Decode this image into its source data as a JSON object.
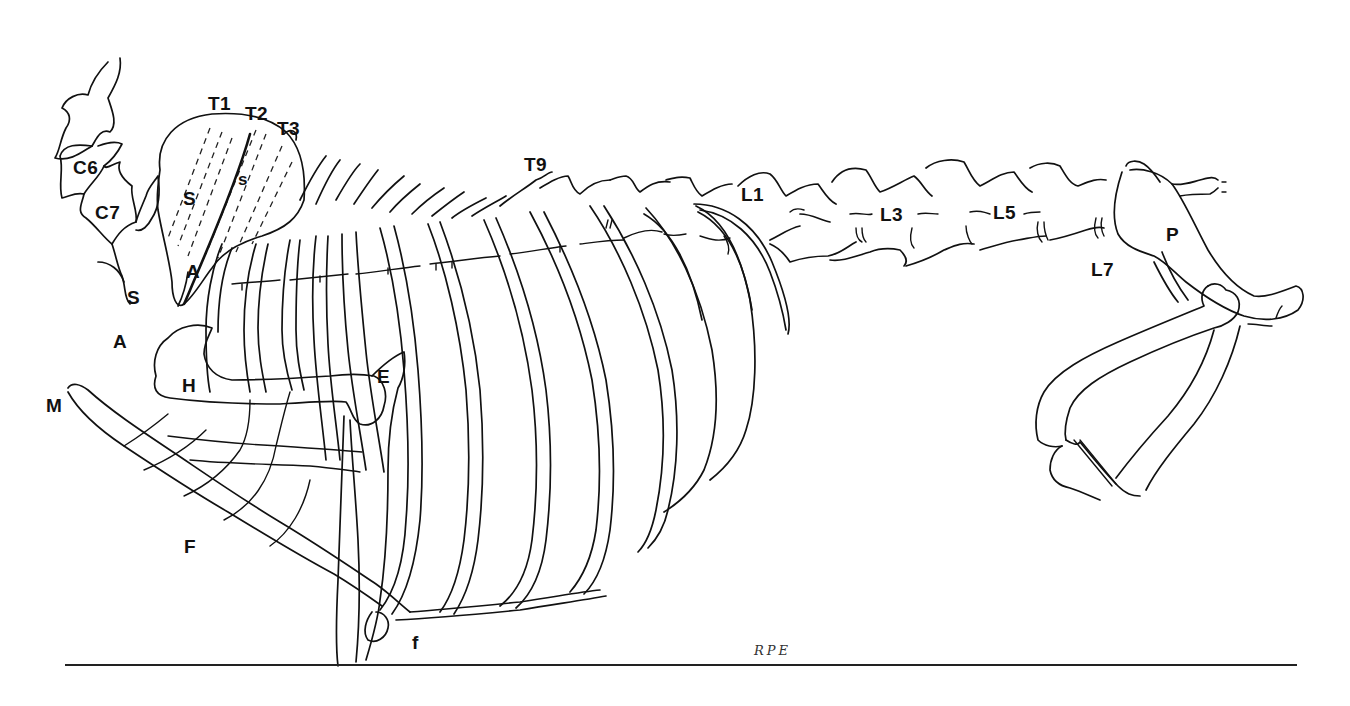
{
  "figure": {
    "signature": "RPE",
    "labels": {
      "T1": "T1",
      "T2": "T2",
      "T3": "T3",
      "T9": "T9",
      "C6": "C6",
      "C7": "C7",
      "S_scapula": "S",
      "s_spine": "s",
      "A_acromion": "A",
      "S_lower": "S",
      "A_lower": "A",
      "H": "H",
      "M": "M",
      "E": "E",
      "F": "F",
      "f": "f",
      "L1": "L1",
      "L3": "L3",
      "L5": "L5",
      "L7": "L7",
      "P": "P"
    },
    "colors": {
      "line": "#111111",
      "background": "#ffffff"
    }
  }
}
